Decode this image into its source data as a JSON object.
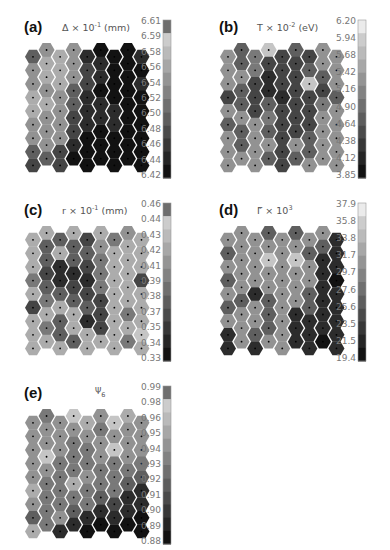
{
  "chart_data": [
    {
      "type": "heatmap",
      "label": "(a)",
      "title": "Δ × 10⁻¹ (mm)",
      "title_parts": {
        "base": "Δ × 10",
        "sup": "-1",
        "rest": " (mm)"
      },
      "layout": "hexagonal self-organizing map, 9 columns × 9 rows",
      "colorbar_ticks": [
        "6.61",
        "6.59",
        "6.58",
        "6.56",
        "6.54",
        "6.52",
        "6.50",
        "6.48",
        "6.46",
        "6.44",
        "6.42"
      ],
      "vmin": 6.42,
      "vmax": 6.61,
      "values": [
        [
          6.5,
          6.53,
          6.56,
          6.55,
          6.44,
          6.43,
          6.43,
          6.43,
          6.45
        ],
        [
          6.53,
          6.57,
          6.56,
          6.54,
          6.46,
          6.45,
          6.43,
          6.43,
          6.42
        ],
        [
          6.55,
          6.56,
          6.57,
          6.53,
          6.47,
          6.44,
          6.43,
          6.43,
          6.44
        ],
        [
          6.56,
          6.55,
          6.55,
          6.5,
          6.44,
          6.43,
          6.43,
          6.42,
          6.42
        ],
        [
          6.56,
          6.56,
          6.55,
          6.48,
          6.44,
          6.44,
          6.44,
          6.43,
          6.42
        ],
        [
          6.55,
          6.55,
          6.54,
          6.47,
          6.44,
          6.44,
          6.44,
          6.42,
          6.42
        ],
        [
          6.55,
          6.55,
          6.55,
          6.46,
          6.43,
          6.43,
          6.42,
          6.42,
          6.42
        ],
        [
          6.5,
          6.53,
          6.46,
          6.44,
          6.42,
          6.42,
          6.42,
          6.42,
          6.42
        ],
        [
          6.46,
          6.48,
          6.47,
          6.43,
          6.42,
          6.42,
          6.42,
          6.42,
          6.42
        ]
      ]
    },
    {
      "type": "heatmap",
      "label": "(b)",
      "title": "T × 10⁻² (eV)",
      "title_parts": {
        "base": "T × 10",
        "sup": "-2",
        "rest": " (eV)"
      },
      "layout": "hexagonal self-organizing map, 9 columns × 9 rows",
      "colorbar_ticks": [
        "6.20",
        "5.94",
        "5.68",
        "5.42",
        "5.16",
        "4.90",
        "4.64",
        "4.38",
        "4.12",
        "3.85"
      ],
      "vmin": 3.85,
      "vmax": 6.2,
      "values": [
        [
          5.2,
          4.7,
          5.1,
          5.9,
          4.5,
          4.7,
          4.5,
          5.2,
          5.2
        ],
        [
          5.2,
          4.7,
          5.1,
          4.4,
          4.3,
          4.4,
          4.7,
          5.2,
          5.2
        ],
        [
          5.2,
          5.2,
          4.4,
          4.2,
          4.3,
          4.4,
          5.9,
          4.7,
          5.2
        ],
        [
          4.3,
          4.7,
          4.3,
          4.0,
          4.1,
          4.3,
          4.4,
          4.4,
          4.8
        ],
        [
          5.2,
          4.7,
          4.4,
          4.8,
          4.3,
          4.3,
          4.4,
          5.0,
          5.2
        ],
        [
          4.7,
          5.2,
          5.2,
          5.1,
          4.4,
          4.3,
          4.4,
          5.2,
          5.2
        ],
        [
          5.2,
          4.7,
          5.2,
          4.7,
          4.4,
          4.4,
          4.7,
          5.2,
          5.2
        ],
        [
          5.2,
          4.7,
          5.2,
          5.2,
          4.4,
          5.2,
          4.7,
          5.2,
          5.2
        ],
        [
          5.2,
          5.2,
          5.2,
          4.7,
          4.4,
          4.7,
          5.2,
          5.2,
          5.2
        ]
      ]
    },
    {
      "type": "heatmap",
      "label": "(c)",
      "title": "r × 10⁻¹ (mm)",
      "title_parts": {
        "base": "r × 10",
        "sup": "-1",
        "rest": " (mm)"
      },
      "layout": "hexagonal self-organizing map, 9 columns × 9 rows",
      "colorbar_ticks": [
        "0.46",
        "0.44",
        "0.43",
        "0.42",
        "0.41",
        "0.39",
        "0.38",
        "0.37",
        "0.35",
        "0.34",
        "0.33"
      ],
      "vmin": 0.33,
      "vmax": 0.46,
      "values": [
        [
          0.42,
          0.42,
          0.38,
          0.42,
          0.36,
          0.42,
          0.4,
          0.41,
          0.42
        ],
        [
          0.42,
          0.38,
          0.42,
          0.38,
          0.38,
          0.41,
          0.42,
          0.42,
          0.42
        ],
        [
          0.42,
          0.38,
          0.35,
          0.38,
          0.36,
          0.4,
          0.42,
          0.42,
          0.42
        ],
        [
          0.4,
          0.36,
          0.35,
          0.34,
          0.34,
          0.4,
          0.42,
          0.42,
          0.36
        ],
        [
          0.42,
          0.38,
          0.38,
          0.36,
          0.36,
          0.4,
          0.42,
          0.42,
          0.42
        ],
        [
          0.37,
          0.4,
          0.42,
          0.38,
          0.38,
          0.37,
          0.42,
          0.42,
          0.42
        ],
        [
          0.42,
          0.42,
          0.38,
          0.42,
          0.34,
          0.36,
          0.42,
          0.4,
          0.42
        ],
        [
          0.42,
          0.4,
          0.38,
          0.42,
          0.42,
          0.36,
          0.42,
          0.42,
          0.44
        ],
        [
          0.42,
          0.42,
          0.42,
          0.38,
          0.42,
          0.42,
          0.42,
          0.4,
          0.42
        ]
      ]
    },
    {
      "type": "heatmap",
      "label": "(d)",
      "title": "Γ̃ × 10³",
      "title_parts": {
        "base": "Γ̃ × 10",
        "sup": "3",
        "rest": ""
      },
      "layout": "hexagonal self-organizing map, 9 columns × 9 rows",
      "colorbar_ticks": [
        "37.9",
        "35.8",
        "33.8",
        "31.7",
        "29.7",
        "27.6",
        "25.6",
        "23.5",
        "21.5",
        "19.4"
      ],
      "vmin": 19.4,
      "vmax": 37.9,
      "values": [
        [
          31.0,
          31.0,
          31.0,
          26.5,
          31.0,
          26.5,
          31.0,
          31.0,
          22.0
        ],
        [
          26.5,
          31.0,
          31.0,
          31.0,
          31.0,
          31.0,
          26.5,
          26.5,
          22.0
        ],
        [
          31.0,
          31.0,
          31.0,
          36.5,
          31.0,
          36.5,
          31.0,
          22.0,
          21.0
        ],
        [
          26.5,
          31.0,
          31.0,
          31.0,
          31.0,
          31.0,
          31.0,
          22.0,
          20.0
        ],
        [
          31.0,
          31.0,
          22.0,
          31.0,
          31.0,
          31.0,
          26.5,
          22.0,
          21.0
        ],
        [
          26.5,
          26.5,
          31.0,
          26.5,
          31.0,
          31.0,
          26.5,
          21.0,
          22.0
        ],
        [
          31.0,
          31.0,
          31.0,
          26.5,
          31.0,
          22.0,
          22.0,
          22.0,
          22.0
        ],
        [
          22.0,
          31.0,
          26.5,
          26.5,
          31.0,
          22.0,
          22.0,
          22.0,
          21.0
        ],
        [
          22.0,
          31.0,
          22.0,
          31.0,
          31.0,
          22.0,
          22.0,
          20.0,
          22.0
        ]
      ]
    },
    {
      "type": "heatmap",
      "label": "(e)",
      "title": "Ψ₆",
      "title_parts": {
        "base": "Ψ",
        "sub": "6",
        "rest": ""
      },
      "layout": "hexagonal self-organizing map, 9 columns × 9 rows",
      "colorbar_ticks": [
        "0.99",
        "0.98",
        "0.96",
        "0.95",
        "0.94",
        "0.93",
        "0.92",
        "0.91",
        "0.90",
        "0.89",
        "0.88"
      ],
      "vmin": 0.88,
      "vmax": 0.99,
      "values": [
        [
          0.95,
          0.94,
          0.95,
          0.97,
          0.96,
          0.95,
          0.97,
          0.96,
          0.95
        ],
        [
          0.95,
          0.95,
          0.95,
          0.95,
          0.95,
          0.94,
          0.95,
          0.95,
          0.95
        ],
        [
          0.95,
          0.95,
          0.95,
          0.93,
          0.93,
          0.95,
          0.97,
          0.95,
          0.95
        ],
        [
          0.95,
          0.97,
          0.93,
          0.93,
          0.94,
          0.95,
          0.94,
          0.95,
          0.94
        ],
        [
          0.95,
          0.95,
          0.93,
          0.93,
          0.95,
          0.94,
          0.94,
          0.94,
          0.92
        ],
        [
          0.96,
          0.93,
          0.94,
          0.96,
          0.94,
          0.93,
          0.93,
          0.92,
          0.9
        ],
        [
          0.95,
          0.93,
          0.94,
          0.94,
          0.93,
          0.92,
          0.91,
          0.9,
          0.89
        ],
        [
          0.92,
          0.93,
          0.95,
          0.92,
          0.9,
          0.9,
          0.89,
          0.89,
          0.88
        ],
        [
          0.96,
          0.94,
          0.89,
          0.89,
          0.88,
          0.88,
          0.88,
          0.88,
          0.88
        ]
      ]
    }
  ]
}
